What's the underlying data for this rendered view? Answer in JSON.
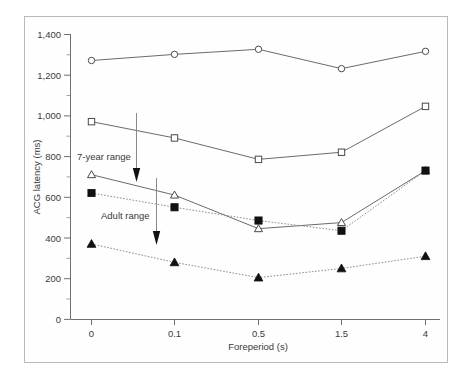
{
  "figure": {
    "caption_visible": false
  },
  "chart_data": {
    "type": "line",
    "title": "",
    "xlabel": "Foreperiod (s)",
    "ylabel": "ACG latency (ms)",
    "x_tick_labels": [
      "0",
      "0.1",
      "0.5",
      "1.5",
      "4"
    ],
    "categories": [
      "0",
      "0.1",
      "0.5",
      "1.5",
      "4"
    ],
    "y_tick_labels": [
      "0",
      "200",
      "400",
      "600",
      "800",
      "1,000",
      "1,200",
      "1,400"
    ],
    "y_ticks": [
      0,
      200,
      400,
      600,
      800,
      1000,
      1200,
      1400
    ],
    "ylim": [
      0,
      1400
    ],
    "grid": false,
    "legend": "none",
    "minor_ticks": true,
    "series": [
      {
        "name": "open-circle-series",
        "marker": "open-circle",
        "line_style": "solid",
        "values": [
          1270,
          1300,
          1325,
          1230,
          1315
        ]
      },
      {
        "name": "open-square-series",
        "marker": "open-square",
        "line_style": "solid",
        "values": [
          970,
          890,
          785,
          820,
          1045
        ]
      },
      {
        "name": "open-triangle-series",
        "marker": "open-triangle",
        "line_style": "solid",
        "values": [
          710,
          610,
          445,
          475,
          730
        ]
      },
      {
        "name": "filled-square-series",
        "marker": "filled-square",
        "line_style": "dotted",
        "values": [
          620,
          550,
          485,
          435,
          730
        ]
      },
      {
        "name": "filled-triangle-series",
        "marker": "filled-triangle",
        "line_style": "dotted",
        "values": [
          370,
          280,
          205,
          250,
          310
        ]
      }
    ],
    "annotations": [
      {
        "name": "seven-year-range",
        "text": "7-year range",
        "arrow": "down",
        "arrow_from_y": 1320,
        "arrow_to_y": 690
      },
      {
        "name": "adult-range",
        "text": "Adult range",
        "arrow": "down",
        "arrow_from_y": 690,
        "arrow_to_y": 370
      }
    ]
  }
}
